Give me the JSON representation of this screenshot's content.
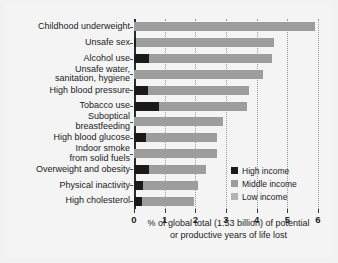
{
  "chart_data": {
    "type": "bar",
    "orientation": "horizontal",
    "stacked": true,
    "title": "",
    "xlabel": "% of global total (1.53 billion) of potential or productive years of life lost",
    "ylabel": "",
    "xlim": [
      0,
      6
    ],
    "xticks": [
      0,
      1,
      2,
      3,
      4,
      5,
      6
    ],
    "xticklabels": [
      "0",
      "1",
      "2",
      "3",
      "4",
      "5",
      "6"
    ],
    "grid": true,
    "grid_axis": "x",
    "grid_style": "dotted",
    "legend_position": "lower right inside plot",
    "categories": [
      "Childhood underweight",
      "Unsafe sex",
      "Alcohol use",
      "Unsafe water,\nsanitation, hygiene",
      "High blood pressure",
      "Tobacco use",
      "Suboptical\nbreastfeeding",
      "High blood glucose",
      "Indoor smoke\nfrom solid fuels",
      "Overweight and obesity",
      "Physical inactivity",
      "High cholesterol"
    ],
    "series": [
      {
        "name": "High income",
        "color": "#1a1a1a",
        "values": [
          0.0,
          0.05,
          0.5,
          0.0,
          0.45,
          0.8,
          0.0,
          0.4,
          0.0,
          0.5,
          0.3,
          0.25
        ]
      },
      {
        "name": "Middle income",
        "color": "#9d9d9d",
        "values": [
          5.9,
          4.5,
          4.0,
          4.2,
          3.3,
          2.9,
          2.9,
          2.3,
          2.7,
          1.85,
          1.8,
          1.7
        ]
      },
      {
        "name": "Low income",
        "color": "#b4b4b4",
        "values": [
          0.0,
          0.0,
          0.0,
          0.0,
          0.0,
          0.0,
          0.0,
          0.0,
          0.0,
          0.0,
          0.0,
          0.0
        ]
      }
    ],
    "totals": [
      5.9,
      4.55,
      4.5,
      4.2,
      3.75,
      3.7,
      2.9,
      2.7,
      2.7,
      2.35,
      2.1,
      1.95
    ],
    "caption_lines": [
      "% of global total (1.53 billion) of potential",
      "or productive years of life lost"
    ]
  },
  "legend": {
    "items": [
      {
        "label": "High income",
        "key": "high"
      },
      {
        "label": "Middle income",
        "key": "middle"
      },
      {
        "label": "Low income",
        "key": "low"
      }
    ]
  },
  "colors": {
    "high_income": "#1a1a1a",
    "middle_income": "#9d9d9d",
    "low_income": "#b4b4b4",
    "axis": "#2b2b2b",
    "grid": "#9a9a9a",
    "background": "#f2f2f2",
    "text": "#1b1b1b"
  }
}
